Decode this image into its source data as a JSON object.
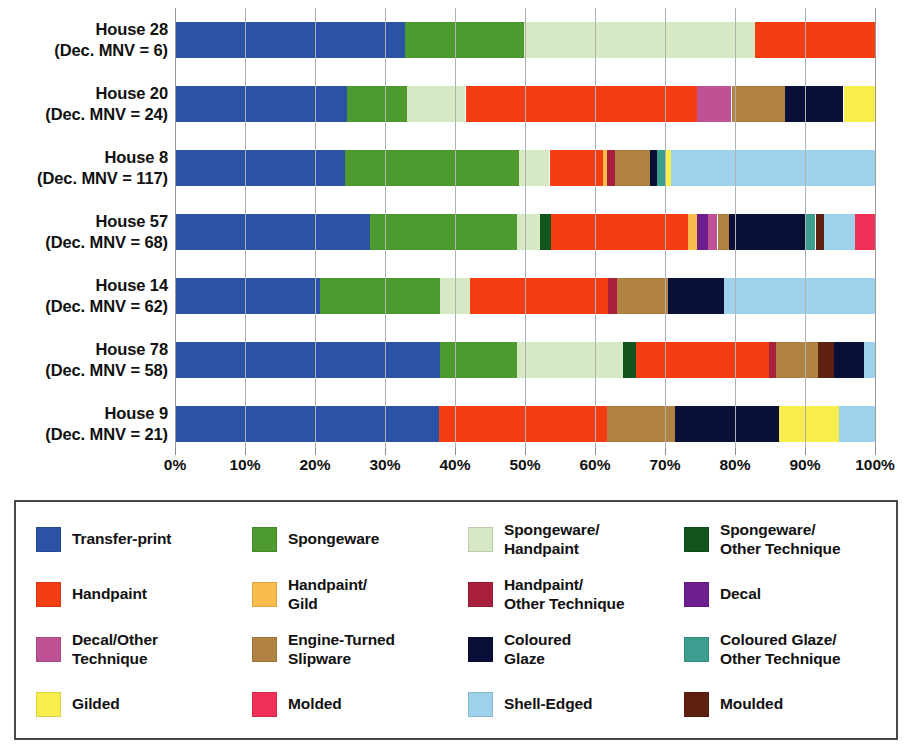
{
  "chart_data": {
    "type": "bar",
    "orientation": "horizontal",
    "stacked": true,
    "normalized": true,
    "title": "",
    "xlabel": "",
    "ylabel": "",
    "xlim": [
      0,
      100
    ],
    "grid": true,
    "legend_position": "bottom",
    "x_ticks": [
      "0%",
      "10%",
      "20%",
      "30%",
      "40%",
      "50%",
      "60%",
      "70%",
      "80%",
      "90%",
      "100%"
    ],
    "x_tick_values": [
      0,
      10,
      20,
      30,
      40,
      50,
      60,
      70,
      80,
      90,
      100
    ],
    "categories": [
      {
        "line1": "House 28",
        "line2": "(Dec. MNV = 6)",
        "mnv": 6
      },
      {
        "line1": "House 20",
        "line2": "(Dec. MNV = 24)",
        "mnv": 24
      },
      {
        "line1": "House 8",
        "line2": "(Dec. MNV = 117)",
        "mnv": 117
      },
      {
        "line1": "House 57",
        "line2": "(Dec. MNV = 68)",
        "mnv": 68
      },
      {
        "line1": "House 14",
        "line2": "(Dec. MNV = 62)",
        "mnv": 62
      },
      {
        "line1": "House 78",
        "line2": "(Dec. MNV = 58)",
        "mnv": 58
      },
      {
        "line1": "House 9",
        "line2": "(Dec. MNV = 21)",
        "mnv": 21
      }
    ],
    "series": [
      {
        "name": "Transfer-print",
        "color": "#2b52a4",
        "values": [
          32.9,
          24.6,
          24.3,
          27.9,
          20.7,
          37.9,
          37.7
        ]
      },
      {
        "name": "Spongeware",
        "color": "#4d9b2f",
        "values": [
          16.9,
          8.6,
          24.9,
          20.9,
          17.1,
          11.0,
          0.0
        ]
      },
      {
        "name": "Spongeware/Handpaint",
        "color": "#d7e8c4",
        "values": [
          33.1,
          8.3,
          4.3,
          3.3,
          4.3,
          15.1,
          0.0
        ]
      },
      {
        "name": "Spongeware/Other Technique",
        "color": "#11541d",
        "values": [
          0.0,
          0.0,
          0.0,
          1.6,
          0.0,
          1.9,
          0.0
        ]
      },
      {
        "name": "Handpaint",
        "color": "#f43d12",
        "values": [
          17.1,
          33.1,
          7.6,
          19.6,
          19.7,
          18.9,
          24.0
        ]
      },
      {
        "name": "Handpaint/Gild",
        "color": "#fbbc4e",
        "values": [
          0.0,
          0.0,
          0.6,
          1.3,
          0.0,
          0.0,
          0.0
        ]
      },
      {
        "name": "Handpaint/Other Technique",
        "color": "#a8203c",
        "values": [
          0.0,
          0.0,
          1.1,
          0.0,
          1.3,
          1.0,
          0.0
        ]
      },
      {
        "name": "Decal",
        "color": "#6d1f8f",
        "values": [
          0.0,
          0.0,
          0.0,
          1.6,
          0.0,
          0.0,
          0.0
        ]
      },
      {
        "name": "Decal/Other Technique",
        "color": "#bf5294",
        "values": [
          0.0,
          4.9,
          0.0,
          1.3,
          0.0,
          0.0,
          0.0
        ]
      },
      {
        "name": "Engine-Turned Slipware",
        "color": "#b08342",
        "values": [
          0.0,
          7.7,
          5.0,
          1.6,
          7.3,
          6.0,
          9.7
        ]
      },
      {
        "name": "Coloured Glaze",
        "color": "#0a0f38",
        "values": [
          0.0,
          8.3,
          1.1,
          11.0,
          8.0,
          4.3,
          14.9
        ]
      },
      {
        "name": "Coloured Glaze/Other Technique",
        "color": "#3c9e8f",
        "values": [
          0.0,
          0.0,
          1.3,
          1.4,
          0.0,
          0.0,
          0.0
        ]
      },
      {
        "name": "Gilded",
        "color": "#f7ee4d",
        "values": [
          0.0,
          4.6,
          0.6,
          0.0,
          0.0,
          0.0,
          8.6
        ]
      },
      {
        "name": "Molded",
        "color": "#ef3057",
        "values": [
          0.0,
          0.0,
          0.0,
          2.9,
          0.0,
          0.0,
          0.0
        ]
      },
      {
        "name": "Shell-Edged",
        "color": "#9ed2ec",
        "values": [
          0.0,
          0.0,
          29.2,
          4.4,
          21.6,
          1.6,
          5.1
        ]
      },
      {
        "name": "Moulded",
        "color": "#5e2110",
        "values": [
          0.0,
          0.0,
          0.0,
          1.2,
          0.0,
          2.3,
          0.0
        ]
      }
    ],
    "stack_order": [
      "Transfer-print",
      "Spongeware",
      "Spongeware/Handpaint",
      "Spongeware/Other Technique",
      "Handpaint",
      "Handpaint/Gild",
      "Handpaint/Other Technique",
      "Decal",
      "Decal/Other Technique",
      "Engine-Turned Slipware",
      "Coloured Glaze",
      "Coloured Glaze/Other Technique",
      "Gilded",
      "Molded",
      "Shell-Edged",
      "Moulded"
    ],
    "bars": [
      {
        "category": "House 28",
        "segments": [
          {
            "label": "Transfer-print",
            "color": "#2b52a4",
            "value": 32.9
          },
          {
            "label": "Spongeware",
            "color": "#4d9b2f",
            "value": 16.9
          },
          {
            "label": "Spongeware/Handpaint",
            "color": "#d7e8c4",
            "value": 33.1
          },
          {
            "label": "Handpaint",
            "color": "#f43d12",
            "value": 17.1
          }
        ]
      },
      {
        "category": "House 20",
        "segments": [
          {
            "label": "Transfer-print",
            "color": "#2b52a4",
            "value": 24.6
          },
          {
            "label": "Spongeware",
            "color": "#4d9b2f",
            "value": 8.6
          },
          {
            "label": "Spongeware/Handpaint",
            "color": "#d7e8c4",
            "value": 8.3
          },
          {
            "label": "Handpaint",
            "color": "#f43d12",
            "value": 33.1
          },
          {
            "label": "Decal/Other Technique",
            "color": "#bf5294",
            "value": 4.9
          },
          {
            "label": "Engine-Turned Slipware",
            "color": "#b08342",
            "value": 7.7
          },
          {
            "label": "Coloured Glaze",
            "color": "#0a0f38",
            "value": 8.3
          },
          {
            "label": "Gilded",
            "color": "#f7ee4d",
            "value": 4.6
          }
        ]
      },
      {
        "category": "House 8",
        "segments": [
          {
            "label": "Transfer-print",
            "color": "#2b52a4",
            "value": 24.3
          },
          {
            "label": "Spongeware",
            "color": "#4d9b2f",
            "value": 24.9
          },
          {
            "label": "Spongeware/Handpaint",
            "color": "#d7e8c4",
            "value": 4.3
          },
          {
            "label": "Handpaint",
            "color": "#f43d12",
            "value": 7.6
          },
          {
            "label": "Handpaint/Gild",
            "color": "#fbbc4e",
            "value": 0.6
          },
          {
            "label": "Handpaint/Other Technique",
            "color": "#a8203c",
            "value": 1.1
          },
          {
            "label": "Engine-Turned Slipware",
            "color": "#b08342",
            "value": 5.0
          },
          {
            "label": "Coloured Glaze",
            "color": "#0a0f38",
            "value": 1.1
          },
          {
            "label": "Coloured Glaze/Other Technique",
            "color": "#3c9e8f",
            "value": 1.3
          },
          {
            "label": "Gilded",
            "color": "#f7ee4d",
            "value": 0.6
          },
          {
            "label": "Shell-Edged",
            "color": "#9ed2ec",
            "value": 29.2
          }
        ]
      },
      {
        "category": "House 57",
        "segments": [
          {
            "label": "Transfer-print",
            "color": "#2b52a4",
            "value": 27.9
          },
          {
            "label": "Spongeware",
            "color": "#4d9b2f",
            "value": 20.9
          },
          {
            "label": "Spongeware/Handpaint",
            "color": "#d7e8c4",
            "value": 3.3
          },
          {
            "label": "Spongeware/Other Technique",
            "color": "#11541d",
            "value": 1.6
          },
          {
            "label": "Handpaint",
            "color": "#f43d12",
            "value": 19.6
          },
          {
            "label": "Handpaint/Gild",
            "color": "#fbbc4e",
            "value": 1.3
          },
          {
            "label": "Decal",
            "color": "#6d1f8f",
            "value": 1.6
          },
          {
            "label": "Decal/Other Technique",
            "color": "#bf5294",
            "value": 1.3
          },
          {
            "label": "Engine-Turned Slipware",
            "color": "#b08342",
            "value": 1.6
          },
          {
            "label": "Coloured Glaze",
            "color": "#0a0f38",
            "value": 11.0
          },
          {
            "label": "Coloured Glaze/Other Technique",
            "color": "#3c9e8f",
            "value": 1.4
          },
          {
            "label": "Moulded",
            "color": "#5e2110",
            "value": 1.2
          },
          {
            "label": "Shell-Edged",
            "color": "#9ed2ec",
            "value": 4.4
          },
          {
            "label": "Molded",
            "color": "#ef3057",
            "value": 2.9
          }
        ]
      },
      {
        "category": "House 14",
        "segments": [
          {
            "label": "Transfer-print",
            "color": "#2b52a4",
            "value": 20.7
          },
          {
            "label": "Spongeware",
            "color": "#4d9b2f",
            "value": 17.1
          },
          {
            "label": "Spongeware/Handpaint",
            "color": "#d7e8c4",
            "value": 4.3
          },
          {
            "label": "Handpaint",
            "color": "#f43d12",
            "value": 19.7
          },
          {
            "label": "Handpaint/Other Technique",
            "color": "#a8203c",
            "value": 1.3
          },
          {
            "label": "Engine-Turned Slipware",
            "color": "#b08342",
            "value": 7.3
          },
          {
            "label": "Coloured Glaze",
            "color": "#0a0f38",
            "value": 8.0
          },
          {
            "label": "Shell-Edged",
            "color": "#9ed2ec",
            "value": 21.6
          }
        ]
      },
      {
        "category": "House 78",
        "segments": [
          {
            "label": "Transfer-print",
            "color": "#2b52a4",
            "value": 37.9
          },
          {
            "label": "Spongeware",
            "color": "#4d9b2f",
            "value": 11.0
          },
          {
            "label": "Spongeware/Handpaint",
            "color": "#d7e8c4",
            "value": 15.1
          },
          {
            "label": "Spongeware/Other Technique",
            "color": "#11541d",
            "value": 1.9
          },
          {
            "label": "Handpaint",
            "color": "#f43d12",
            "value": 18.9
          },
          {
            "label": "Handpaint/Other Technique",
            "color": "#a8203c",
            "value": 1.0
          },
          {
            "label": "Engine-Turned Slipware",
            "color": "#b08342",
            "value": 6.0
          },
          {
            "label": "Moulded",
            "color": "#5e2110",
            "value": 2.3
          },
          {
            "label": "Coloured Glaze",
            "color": "#0a0f38",
            "value": 4.3
          },
          {
            "label": "Shell-Edged",
            "color": "#9ed2ec",
            "value": 1.6
          }
        ]
      },
      {
        "category": "House 9",
        "segments": [
          {
            "label": "Transfer-print",
            "color": "#2b52a4",
            "value": 37.7
          },
          {
            "label": "Handpaint",
            "color": "#f43d12",
            "value": 24.0
          },
          {
            "label": "Engine-Turned Slipware",
            "color": "#b08342",
            "value": 9.7
          },
          {
            "label": "Coloured Glaze",
            "color": "#0a0f38",
            "value": 14.9
          },
          {
            "label": "Gilded",
            "color": "#f7ee4d",
            "value": 8.6
          },
          {
            "label": "Shell-Edged",
            "color": "#9ed2ec",
            "value": 5.1
          }
        ]
      }
    ]
  },
  "legend": {
    "items": [
      {
        "label_lines": [
          "Transfer-print"
        ],
        "color": "#2b52a4"
      },
      {
        "label_lines": [
          "Spongeware"
        ],
        "color": "#4d9b2f"
      },
      {
        "label_lines": [
          "Spongeware/",
          "Handpaint"
        ],
        "color": "#d7e8c4"
      },
      {
        "label_lines": [
          "Spongeware/",
          "Other Technique"
        ],
        "color": "#11541d"
      },
      {
        "label_lines": [
          "Handpaint"
        ],
        "color": "#f43d12"
      },
      {
        "label_lines": [
          "Handpaint/",
          "Gild"
        ],
        "color": "#fbbc4e"
      },
      {
        "label_lines": [
          "Handpaint/",
          "Other Technique"
        ],
        "color": "#a8203c"
      },
      {
        "label_lines": [
          "Decal"
        ],
        "color": "#6d1f8f"
      },
      {
        "label_lines": [
          "Decal/Other",
          "Technique"
        ],
        "color": "#bf5294"
      },
      {
        "label_lines": [
          "Engine-Turned",
          "Slipware"
        ],
        "color": "#b08342"
      },
      {
        "label_lines": [
          "Coloured",
          "Glaze"
        ],
        "color": "#0a0f38"
      },
      {
        "label_lines": [
          "Coloured Glaze/",
          "Other Technique"
        ],
        "color": "#3c9e8f"
      },
      {
        "label_lines": [
          "Gilded"
        ],
        "color": "#f7ee4d"
      },
      {
        "label_lines": [
          "Molded"
        ],
        "color": "#ef3057"
      },
      {
        "label_lines": [
          "Shell-Edged"
        ],
        "color": "#9ed2ec"
      },
      {
        "label_lines": [
          "Moulded"
        ],
        "color": "#5e2110"
      }
    ]
  }
}
